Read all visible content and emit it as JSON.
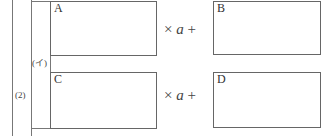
{
  "problem": {
    "number_label": "(2)",
    "sub_label": "(イ)"
  },
  "rows": [
    {
      "left_box_label": "A",
      "times": "×",
      "variable": "a",
      "plus": "+",
      "right_box_label": "B"
    },
    {
      "left_box_label": "C",
      "times": "×",
      "variable": "a",
      "plus": "+",
      "right_box_label": "D"
    }
  ]
}
